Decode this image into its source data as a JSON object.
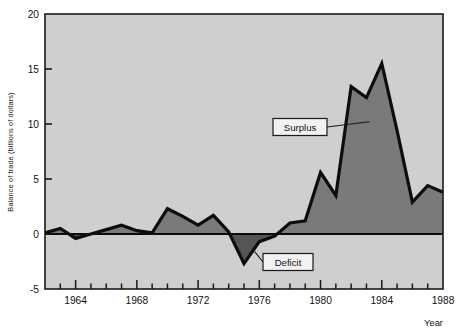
{
  "chart_data": {
    "type": "area",
    "title": "",
    "xlabel": "Year",
    "ylabel": "Balance of trade (billions of dollars)",
    "xlim": [
      1962,
      1988
    ],
    "ylim": [
      -5,
      20
    ],
    "ytick_labels": [
      "20",
      "15",
      "10",
      "5",
      "0",
      "-5"
    ],
    "ytick_values": [
      20,
      15,
      10,
      5,
      0,
      -5
    ],
    "xtick_labels": [
      "1964",
      "1968",
      "1972",
      "1976",
      "1980",
      "1984",
      "1988"
    ],
    "xtick_values": [
      1964,
      1968,
      1972,
      1976,
      1980,
      1984,
      1988
    ],
    "minor_tick_years": [
      1962,
      1963,
      1964,
      1965,
      1966,
      1967,
      1968,
      1969,
      1970,
      1971,
      1972,
      1973,
      1974,
      1975,
      1976,
      1977,
      1978,
      1979,
      1980,
      1981,
      1982,
      1983,
      1984,
      1985,
      1986,
      1987,
      1988
    ],
    "grid": false,
    "legend_position": "none",
    "series": [
      {
        "name": "Balance of trade",
        "x": [
          1962,
          1963,
          1964,
          1965,
          1966,
          1967,
          1968,
          1969,
          1970,
          1971,
          1972,
          1973,
          1974,
          1975,
          1976,
          1977,
          1978,
          1979,
          1980,
          1981,
          1982,
          1983,
          1984,
          1985,
          1986,
          1987,
          1988
        ],
        "values": [
          0.1,
          0.5,
          -0.4,
          0.0,
          0.4,
          0.8,
          0.3,
          0.1,
          2.3,
          1.6,
          0.8,
          1.7,
          0.2,
          -2.7,
          -0.7,
          -0.2,
          1.0,
          1.2,
          5.6,
          3.5,
          13.4,
          12.4,
          15.5,
          9.4,
          2.9,
          4.4,
          3.8
        ]
      }
    ],
    "annotations": [
      {
        "label": "Surplus",
        "target_year": 1983.2,
        "target_value": 10.2
      },
      {
        "label": "Deficit",
        "target_year": 1975.7,
        "target_value": -1.6
      }
    ],
    "colors": {
      "surplus_fill": "#7a7a7a",
      "deficit_fill": "#555555",
      "plot_background": "#cfcfcf",
      "line": "#0d0d0d",
      "axis": "#1a1a1a",
      "callout_box": "#f2f2f2",
      "page_background": "#ffffff"
    }
  }
}
